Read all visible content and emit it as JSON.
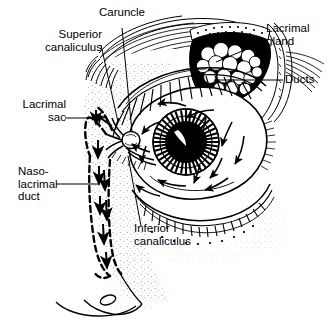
{
  "figure": {
    "background_color": "#ffffff",
    "ink_color": "#000000",
    "width": 327,
    "height": 326
  },
  "labels": {
    "caruncle": "Caruncle",
    "superior_canaliculus": "Superior\ncanaliculus",
    "lacrimal_sac": "Lacrimal\nsac",
    "nasolacrimal_duct": "Naso-\nlacrimal\nduct",
    "inferior_canaliculus": "Inferior\ncanaliculus",
    "lacrimal_gland": "Lacrimal\ngland",
    "ducts": "Ducts"
  },
  "structures": [
    "eyebrow",
    "upper-eyelid",
    "lower-eyelid",
    "eyelashes",
    "eyeball-sclera",
    "iris",
    "pupil",
    "corneal-highlight",
    "lacrimal-gland",
    "lacrimal-gland-ducts",
    "lacrimal-caruncle",
    "superior-canaliculus",
    "inferior-canaliculus",
    "lacrimal-sac",
    "nasolacrimal-duct",
    "nose-profile",
    "tear-flow-arrows"
  ],
  "tear_flow": {
    "description": "Arrows show tears sweeping from the lacrimal gland across the eye toward the inner canthus, then down the nasolacrimal duct into the nose.",
    "arrow_count_on_eye": 12,
    "arrow_count_in_duct": 6
  }
}
